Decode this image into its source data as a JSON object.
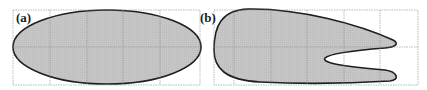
{
  "panels": [
    {
      "label": "(a)",
      "shape": "ellipse"
    },
    {
      "label": "(b)",
      "shape": "forked-tongue"
    }
  ],
  "colors": {
    "fill": "#c4c4c4",
    "outline": "#222222",
    "grid": "#9a9a9a",
    "background": "#ffffff"
  }
}
